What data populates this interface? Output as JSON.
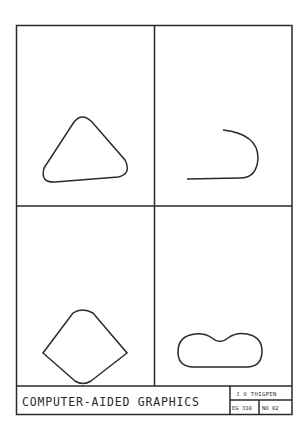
{
  "sheet": {
    "title": "COMPUTER-AIDED GRAPHICS",
    "author": "J O THIGPEN",
    "course": "EG 310",
    "number": "NO 02"
  },
  "panels": [
    {
      "id": "top-left",
      "shape": "rounded-triangle"
    },
    {
      "id": "top-right",
      "shape": "j-hook-curve"
    },
    {
      "id": "bottom-left",
      "shape": "rounded-kite"
    },
    {
      "id": "bottom-right",
      "shape": "peanut-outline"
    }
  ],
  "colors": {
    "ink": "#2a2a2a",
    "paper": "#ffffff"
  }
}
